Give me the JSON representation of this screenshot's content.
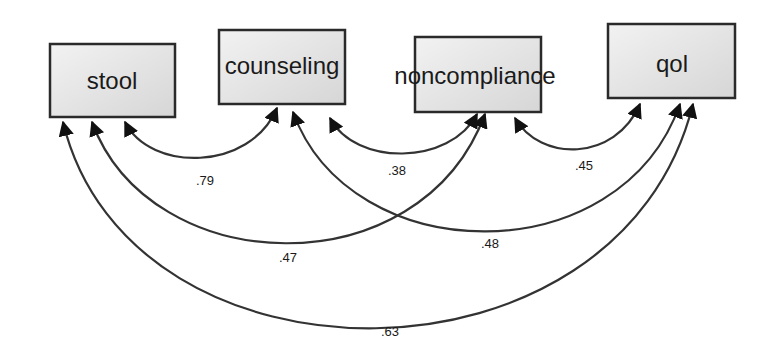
{
  "diagram": {
    "type": "path diagram (correlations among observed variables)",
    "nodes": [
      {
        "id": "stool",
        "label": "stool",
        "x": 50,
        "y": 44,
        "w": 125,
        "h": 73,
        "label_x": 112,
        "label_y": 89
      },
      {
        "id": "counseling",
        "label": "counseling",
        "x": 219,
        "y": 30,
        "w": 126,
        "h": 74,
        "label_x": 282,
        "label_y": 74
      },
      {
        "id": "noncompliance",
        "label": "noncompliance",
        "x": 415,
        "y": 37,
        "w": 126,
        "h": 75,
        "label_x": 475,
        "label_y": 84
      },
      {
        "id": "qol",
        "label": "qol",
        "x": 608,
        "y": 24,
        "w": 127,
        "h": 74,
        "label_x": 672,
        "label_y": 72
      }
    ],
    "edges": [
      {
        "from": "stool",
        "to": "counseling",
        "label": ".79",
        "path": "M125,122 C150,172 250,172 277,108",
        "label_x": 205,
        "label_y": 185
      },
      {
        "from": "counseling",
        "to": "noncompliance",
        "label": ".38",
        "path": "M330,118 C355,166 450,166 477,114",
        "label_x": 397,
        "label_y": 175
      },
      {
        "from": "noncompliance",
        "to": "qol",
        "label": ".45",
        "path": "M515,118 C540,162 615,162 640,104",
        "label_x": 584,
        "label_y": 170
      },
      {
        "from": "stool",
        "to": "noncompliance",
        "label": ".47",
        "path": "M92,122 C150,280 420,290 485,114",
        "label_x": 288,
        "label_y": 262
      },
      {
        "from": "counseling",
        "to": "qol",
        "label": ".48",
        "path": "M293,112 C350,270 620,275 680,104",
        "label_x": 490,
        "label_y": 248
      },
      {
        "from": "stool",
        "to": "qol",
        "label": ".63",
        "path": "M63,122 C130,400 620,400 693,104",
        "label_x": 390,
        "label_y": 336
      }
    ]
  },
  "colors": {
    "box_fill_light": "#efefef",
    "box_fill_dark": "#d8d8d8",
    "box_stroke": "#2a2a2a",
    "edge_stroke": "#333333",
    "text": "#1a1a1a",
    "background": "#ffffff"
  }
}
